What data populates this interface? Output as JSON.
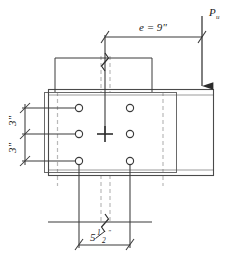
{
  "figure": {
    "type": "engineering-detail-drawing",
    "colors": {
      "line": "#3a3a3a",
      "member_outline": "#555555",
      "hidden_line": "#b5b5b5",
      "text": "#1a1a1a",
      "background": "#ffffff"
    }
  },
  "dimensions": {
    "eccentricity": {
      "label": "e = 9\"",
      "symbol": "e",
      "equals": "=",
      "value": "9\""
    },
    "bolt_spacing_vertical_top": {
      "label": "3\"",
      "value": "3\""
    },
    "bolt_spacing_vertical_bottom": {
      "label": "3\"",
      "value": "3\""
    },
    "bolt_gage_horizontal": {
      "label": "5½\"",
      "whole": "5",
      "numerator": "1",
      "denominator": "2",
      "unit": "\""
    }
  },
  "load": {
    "label": "P",
    "subscript": "u",
    "direction": "downward"
  },
  "bolts": {
    "count": 6,
    "columns": 2,
    "rows": 3,
    "positions": [
      {
        "id": "bolt-top-left",
        "cx": 79,
        "cy": 108
      },
      {
        "id": "bolt-top-right",
        "cx": 130,
        "cy": 108
      },
      {
        "id": "bolt-mid-left",
        "cx": 79,
        "cy": 134
      },
      {
        "id": "bolt-mid-right",
        "cx": 130,
        "cy": 134
      },
      {
        "id": "bolt-bot-left",
        "cx": 79,
        "cy": 161
      },
      {
        "id": "bolt-bot-right",
        "cx": 130,
        "cy": 161
      }
    ]
  },
  "centroid": {
    "cx": 105,
    "cy": 134,
    "marker": "cross"
  },
  "members": {
    "beam": {
      "x": 48,
      "y": 89,
      "w": 166,
      "h": 86,
      "flange_thickness": 5
    },
    "plate": {
      "x": 44,
      "y": 92,
      "w": 132,
      "h": 80
    }
  }
}
